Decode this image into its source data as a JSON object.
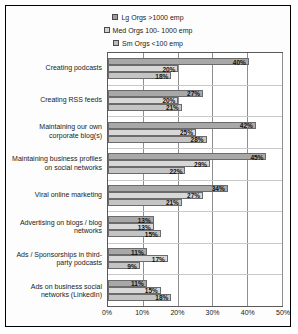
{
  "chart_data": {
    "type": "bar",
    "orientation": "horizontal",
    "title": "",
    "xlabel": "",
    "ylabel": "",
    "xlim": [
      0,
      50
    ],
    "xticks": [
      "0%",
      "10%",
      "20%",
      "30%",
      "40%",
      "50%"
    ],
    "xtick_values": [
      0,
      10,
      20,
      30,
      40,
      50
    ],
    "grid": true,
    "legend_position": "top",
    "categories": [
      "Creating podcasts",
      "Creating RSS feeds",
      "Maintaining our own corporate blog(s)",
      "Maintaining business profiles on social networks",
      "Viral online marketing",
      "Advertising on blogs / blog networks",
      "Ads / Sponsorships in third-party podcasts",
      "Ads on business social networks (LinkedIn)"
    ],
    "series": [
      {
        "name": "Lg Orgs >1000 emp",
        "color": "#a8a8a8",
        "values": [
          40,
          27,
          42,
          45,
          34,
          13,
          11,
          11
        ],
        "labels": [
          "40%",
          "27%",
          "42%",
          "45%",
          "34%",
          "13%",
          "11%",
          "11%"
        ]
      },
      {
        "name": "Med Orgs 100-1000 emp",
        "color": "#d8d8d8",
        "values": [
          20,
          20,
          25,
          29,
          27,
          13,
          17,
          15
        ],
        "labels": [
          "20%",
          "20%",
          "25%",
          "29%",
          "27%",
          "13%",
          "17%",
          "15%"
        ]
      },
      {
        "name": "Sm Orgs <100 emp",
        "color": "#c4c4c4",
        "values": [
          18,
          21,
          28,
          22,
          21,
          15,
          9,
          18
        ],
        "labels": [
          "18%",
          "21%",
          "28%",
          "22%",
          "21%",
          "15%",
          "9%",
          "18%"
        ]
      }
    ]
  },
  "legend": {
    "items": [
      {
        "label": "Lg Orgs >1000 emp",
        "swatch": "legend-swatch-lg"
      },
      {
        "label": "Med Orgs 100- 1000 emp",
        "swatch": "legend-swatch-med"
      },
      {
        "label": "Sm Orgs <100 emp",
        "swatch": "legend-swatch-sm"
      }
    ]
  }
}
